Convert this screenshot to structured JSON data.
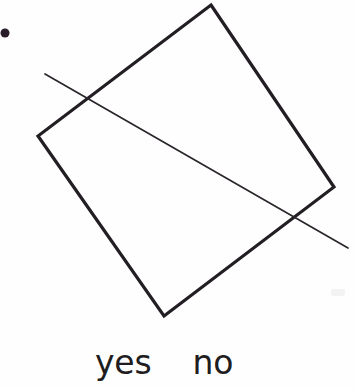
{
  "page": {
    "width": 356,
    "height": 389,
    "background_color": "#fefefe",
    "kind": "scanned-figure-with-answer-choices"
  },
  "figure": {
    "title": "",
    "ink_color": "#211d22",
    "bullet": {
      "name": "item-bullet",
      "cx": 5,
      "cy": 33,
      "r": 4.5,
      "color": "#2a1d2a"
    },
    "quadrilateral": {
      "name": "tilted-square",
      "stroke_color": "#221e23",
      "stroke_width": 3.2,
      "fill": "none",
      "points": "211,5 334,187 164,316 38,136"
    },
    "crossing_line": {
      "name": "diagonal-line",
      "stroke_color": "#2a262b",
      "stroke_width": 1.7,
      "x1": 45,
      "y1": 74,
      "x2": 348,
      "y2": 248,
      "intersections": [
        {
          "x": 88,
          "y": 100
        },
        {
          "x": 300,
          "y": 218
        }
      ]
    },
    "scan_smudge": {
      "name": "scan-artifact",
      "x": 331,
      "y": 289,
      "width": 14,
      "height": 7,
      "color": "#f3f3f4"
    }
  },
  "answers": {
    "options": [
      {
        "label": "yes",
        "value": "yes"
      },
      {
        "label": "no",
        "value": "no"
      }
    ],
    "selected": null,
    "font_size_px": 33,
    "text_color": "#201c20"
  }
}
